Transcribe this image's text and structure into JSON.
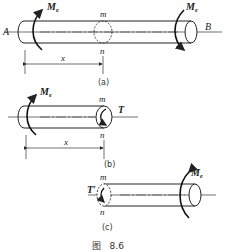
{
  "figure": {
    "caption": "图   8.6",
    "subfigures": [
      {
        "id": "a",
        "label": "(a)",
        "left_end": "A",
        "right_end": "B",
        "left_moment": {
          "symbol": "M",
          "subscript": "e"
        },
        "right_moment": {
          "symbol": "M",
          "subscript": "e"
        },
        "section_top": "m",
        "section_bottom": "n",
        "dimension": "x"
      },
      {
        "id": "b",
        "label": "(b)",
        "left_moment": {
          "symbol": "M",
          "subscript": "e"
        },
        "section_top": "m",
        "section_bottom": "n",
        "internal_torque": "T",
        "dimension": "x"
      },
      {
        "id": "c",
        "label": "(c)",
        "right_moment": {
          "symbol": "M",
          "subscript": "e"
        },
        "section_top": "m",
        "section_bottom": "n",
        "internal_torque": "T′"
      }
    ]
  }
}
